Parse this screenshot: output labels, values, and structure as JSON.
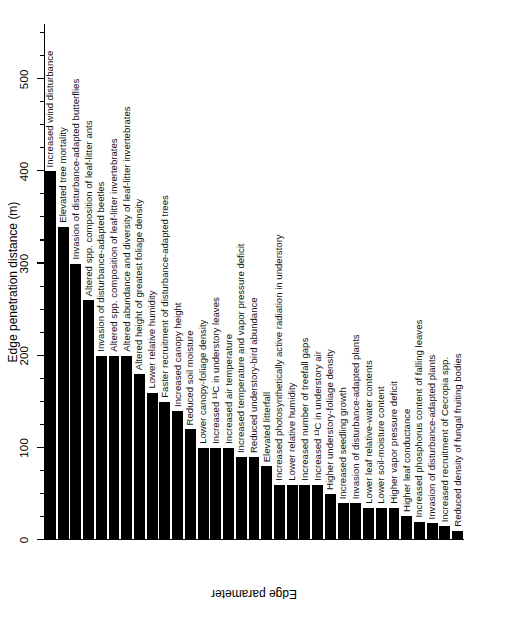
{
  "figure": {
    "value_axis_title": "Edge penetration distance (m)",
    "category_axis_title": "Edge parameter",
    "ink_color": "#000000",
    "background_color": "#ffffff"
  },
  "axis": {
    "major_ticks": [
      0,
      100,
      200,
      300,
      400,
      500
    ],
    "major_tick_labels": [
      "0",
      "100",
      "200",
      "300",
      "400",
      "500"
    ],
    "minor_tick_interval": 25,
    "min": 0,
    "max": 560
  },
  "chart_data": {
    "type": "bar",
    "orientation": "vertical-bars-in-rotated-figure",
    "title": "",
    "xlabel": "Edge parameter",
    "ylabel": "Edge penetration distance (m)",
    "ylim": [
      0,
      560
    ],
    "grid": false,
    "legend": null,
    "categories": [
      "Increased wind disturbance",
      "Elevated tree mortality",
      "Invasion of disturbance-adapted butterflies",
      "Altered spp. composition of leaf-litter ants",
      "Invasion of disturbance-adapted beetles",
      "Altered spp. composition of leaf-litter invertebrates",
      "Altered abundance and diversity of leaf-litter invertebrates",
      "Altered height of greatest foliage density",
      "Lower relative humidity",
      "Faster recruitment of disturbance-adapted trees",
      "Increased canopy height",
      "Reduced soil moisture",
      "Lower canopy-foliage density",
      "Increased ¹³C in understory leaves",
      "Increased air temperature",
      "Increased temperature and vapor pressure deficit",
      "Reduced understory-bird abundance",
      "Elevated litterfall",
      "Increased photosynthetically active radiation in understory",
      "Lower relative humidity",
      "Increased number of treefall gaps",
      "Increased ¹³C in understory air",
      "Higher understory-foliage density",
      "Increased seedling growth",
      "Invasion of disturbance-adapted plants",
      "Lower leaf relative-water contents",
      "Lower soil-moisture content",
      "Higher vapor pressure deficit",
      "Higher leaf conductance",
      "Increased phosphorus content of falling leaves",
      "Invasion of disturbance-adapted plants",
      "Increased recruitment of Cecropia spp.",
      "Reduced density of fungal fruiting bodies"
    ],
    "values": [
      400,
      340,
      300,
      260,
      200,
      200,
      200,
      180,
      160,
      150,
      140,
      120,
      100,
      100,
      100,
      90,
      90,
      80,
      60,
      60,
      60,
      60,
      50,
      40,
      40,
      35,
      35,
      35,
      26,
      20,
      18,
      15,
      10
    ],
    "value_unit": "m",
    "n_bars": 33,
    "bar_color": "#000000"
  }
}
